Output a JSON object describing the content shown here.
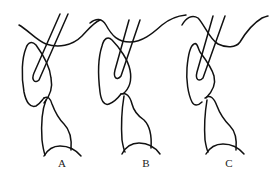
{
  "figure": {
    "type": "line-drawing",
    "panels": [
      {
        "label": "A",
        "label_x": 62,
        "label_y": 157
      },
      {
        "label": "B",
        "label_x": 146,
        "label_y": 157
      },
      {
        "label": "C",
        "label_x": 229,
        "label_y": 157
      }
    ],
    "stroke_color": "#111111",
    "background": "#ffffff"
  }
}
